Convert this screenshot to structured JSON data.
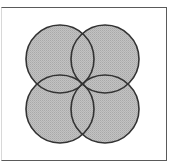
{
  "diagram": {
    "type": "four-circle-overlap",
    "colors": {
      "fill": "#bababa",
      "stroke": "#333333",
      "frame": "#5a5a5a",
      "background": "#ffffff"
    },
    "circles": [
      {
        "id": "top-left",
        "cx": 60,
        "cy": 59,
        "r": 34
      },
      {
        "id": "top-right",
        "cx": 105,
        "cy": 59,
        "r": 34
      },
      {
        "id": "bottom-left",
        "cx": 60,
        "cy": 109,
        "r": 34
      },
      {
        "id": "bottom-right",
        "cx": 105,
        "cy": 109,
        "r": 34
      }
    ]
  }
}
